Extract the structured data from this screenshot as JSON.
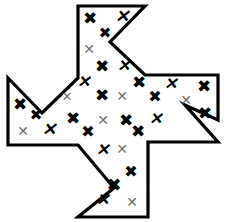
{
  "figure": {
    "canvas": {
      "width": 226,
      "height": 222
    },
    "background_color": "#ffffff",
    "outline_color": "#000000",
    "outline_width": 3.2,
    "fill_color": "#ffffff",
    "shape": {
      "name": "pinwheel-cross-polygon",
      "vertex_count": 16,
      "points": "78,6 145,6 110,42 145,75 218,75 218,120 185,105 218,142 148,142 148,217 78,217 114,188 78,145 8,145 8,78 42,113 78,78",
      "notches": [
        {
          "name": "top-notch",
          "direction": "left",
          "apex": "110,42"
        },
        {
          "name": "right-notch",
          "direction": "up",
          "apex": "185,105"
        },
        {
          "name": "bottom-notch",
          "direction": "right",
          "apex": "114,188"
        },
        {
          "name": "left-notch",
          "direction": "down",
          "apex": "42,113"
        }
      ]
    },
    "mark_styles": {
      "bold": {
        "glyph": "✖",
        "color": "#000000",
        "label": "bold-black-x"
      },
      "bold_italic": {
        "glyph": "✕",
        "color": "#000000",
        "label": "bold-italic-x"
      },
      "thin": {
        "glyph": "✕",
        "color": "#6e6e6e",
        "label": "thin-gray-x"
      }
    },
    "marks": [
      {
        "id": "m01",
        "style": "bold",
        "x": 90,
        "y": 18,
        "size": 17,
        "rot": 0,
        "glyph": "✖"
      },
      {
        "id": "m02",
        "style": "bold_italic",
        "x": 122,
        "y": 16,
        "size": 17,
        "rot": 0,
        "glyph": "✕"
      },
      {
        "id": "m03",
        "style": "bold",
        "x": 105,
        "y": 33,
        "size": 15,
        "rot": 0,
        "glyph": "✖"
      },
      {
        "id": "m04",
        "style": "thin",
        "x": 89,
        "y": 49,
        "size": 14,
        "rot": 0,
        "glyph": "✕"
      },
      {
        "id": "m05",
        "style": "bold",
        "x": 102,
        "y": 66,
        "size": 17,
        "rot": 0,
        "glyph": "✖"
      },
      {
        "id": "m06",
        "style": "bold_italic",
        "x": 123,
        "y": 66,
        "size": 16,
        "rot": 0,
        "glyph": "✕"
      },
      {
        "id": "m07",
        "style": "bold_italic",
        "x": 83,
        "y": 82,
        "size": 16,
        "rot": 0,
        "glyph": "✕"
      },
      {
        "id": "m08",
        "style": "bold",
        "x": 139,
        "y": 82,
        "size": 17,
        "rot": 0,
        "glyph": "✖"
      },
      {
        "id": "m09",
        "style": "bold_italic",
        "x": 170,
        "y": 84,
        "size": 16,
        "rot": 0,
        "glyph": "✕"
      },
      {
        "id": "m10",
        "style": "bold",
        "x": 204,
        "y": 86,
        "size": 17,
        "rot": 0,
        "glyph": "✖"
      },
      {
        "id": "m11",
        "style": "thin",
        "x": 67,
        "y": 96,
        "size": 13,
        "rot": 0,
        "glyph": "✕"
      },
      {
        "id": "m12",
        "style": "bold",
        "x": 20,
        "y": 104,
        "size": 17,
        "rot": 0,
        "glyph": "✖"
      },
      {
        "id": "m13",
        "style": "bold",
        "x": 102,
        "y": 95,
        "size": 17,
        "rot": 0,
        "glyph": "✖"
      },
      {
        "id": "m14",
        "style": "thin",
        "x": 122,
        "y": 96,
        "size": 14,
        "rot": 0,
        "glyph": "✕"
      },
      {
        "id": "m15",
        "style": "bold",
        "x": 155,
        "y": 97,
        "size": 16,
        "rot": 0,
        "glyph": "✖"
      },
      {
        "id": "m16",
        "style": "thin",
        "x": 186,
        "y": 100,
        "size": 14,
        "rot": 0,
        "glyph": "✕"
      },
      {
        "id": "m17",
        "style": "bold",
        "x": 205,
        "y": 113,
        "size": 17,
        "rot": 0,
        "glyph": "✖"
      },
      {
        "id": "m18",
        "style": "bold",
        "x": 36,
        "y": 115,
        "size": 15,
        "rot": 0,
        "glyph": "✖"
      },
      {
        "id": "m19",
        "style": "bold",
        "x": 73,
        "y": 118,
        "size": 17,
        "rot": 0,
        "glyph": "✖"
      },
      {
        "id": "m20",
        "style": "thin",
        "x": 103,
        "y": 120,
        "size": 14,
        "rot": 0,
        "glyph": "✕"
      },
      {
        "id": "m21",
        "style": "bold",
        "x": 126,
        "y": 120,
        "size": 17,
        "rot": 0,
        "glyph": "✖"
      },
      {
        "id": "m22",
        "style": "bold_italic",
        "x": 155,
        "y": 119,
        "size": 16,
        "rot": 0,
        "glyph": "✕"
      },
      {
        "id": "m23",
        "style": "thin",
        "x": 23,
        "y": 131,
        "size": 14,
        "rot": 0,
        "glyph": "✕"
      },
      {
        "id": "m24",
        "style": "bold_italic",
        "x": 49,
        "y": 129,
        "size": 17,
        "rot": 0,
        "glyph": "✕"
      },
      {
        "id": "m25",
        "style": "bold",
        "x": 88,
        "y": 132,
        "size": 16,
        "rot": 0,
        "glyph": "✖"
      },
      {
        "id": "m26",
        "style": "bold",
        "x": 138,
        "y": 131,
        "size": 17,
        "rot": 0,
        "glyph": "✖"
      },
      {
        "id": "m27",
        "style": "bold_italic",
        "x": 102,
        "y": 150,
        "size": 16,
        "rot": 0,
        "glyph": "✕"
      },
      {
        "id": "m28",
        "style": "thin",
        "x": 122,
        "y": 149,
        "size": 14,
        "rot": 0,
        "glyph": "✕"
      },
      {
        "id": "m29",
        "style": "bold",
        "x": 131,
        "y": 172,
        "size": 16,
        "rot": 0,
        "glyph": "✖"
      },
      {
        "id": "m30",
        "style": "bold",
        "x": 114,
        "y": 185,
        "size": 18,
        "rot": 0,
        "glyph": "✖"
      },
      {
        "id": "m31",
        "style": "bold_italic",
        "x": 102,
        "y": 200,
        "size": 16,
        "rot": 0,
        "glyph": "✕"
      },
      {
        "id": "m32",
        "style": "thin",
        "x": 132,
        "y": 202,
        "size": 14,
        "rot": 0,
        "glyph": "✕"
      }
    ],
    "counts": {
      "total_marks": 32,
      "bold_marks": 17,
      "bold_italic_marks": 8,
      "thin_marks": 7
    }
  }
}
